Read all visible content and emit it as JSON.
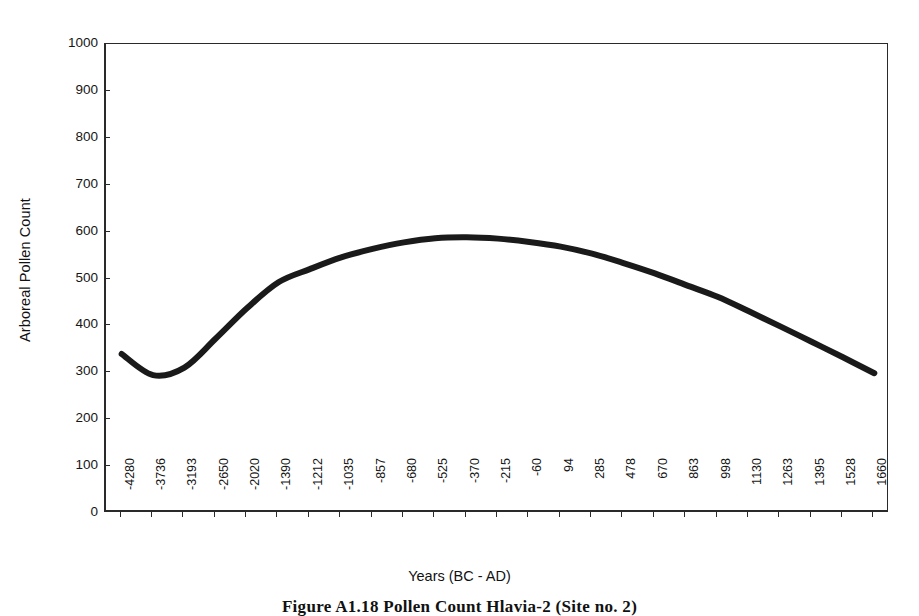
{
  "figure": {
    "caption": "Figure A1.18   Pollen Count Hlavia-2 (Site no. 2)"
  },
  "chart_data": {
    "type": "line",
    "title": "",
    "xlabel": "Years (BC - AD)",
    "ylabel": "Arboreal Pollen Count",
    "ylim": [
      0,
      1000
    ],
    "ytick_labels": [
      "1000",
      "900",
      "800",
      "700",
      "600",
      "500",
      "400",
      "300",
      "200",
      "100",
      "0"
    ],
    "ytick_values": [
      1000,
      900,
      800,
      700,
      600,
      500,
      400,
      300,
      200,
      100,
      0
    ],
    "grid": false,
    "legend": "none",
    "line_color": "#1a1a1a",
    "line_width": 6,
    "categories": [
      "-4280",
      "-3736",
      "-3193",
      "-2650",
      "-2020",
      "-1390",
      "-1212",
      "-1035",
      "-857",
      "-680",
      "-525",
      "-370",
      "-215",
      "-60",
      "94",
      "285",
      "478",
      "670",
      "863",
      "998",
      "1130",
      "1263",
      "1395",
      "1528",
      "1660"
    ],
    "series": [
      {
        "name": "Arboreal Pollen Count",
        "values": [
          339,
          294,
          310,
          372,
          437,
          492,
          520,
          545,
          563,
          577,
          586,
          588,
          585,
          578,
          568,
          553,
          533,
          511,
          486,
          461,
          430,
          398,
          365,
          332,
          298
        ]
      }
    ]
  }
}
